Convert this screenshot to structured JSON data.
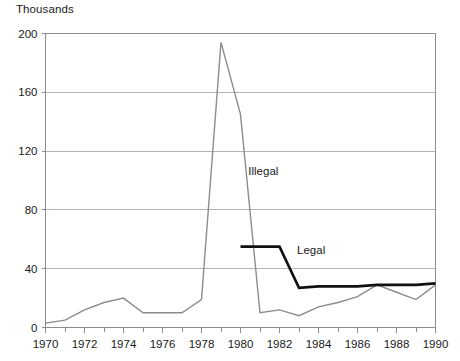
{
  "chart_data": {
    "type": "line",
    "title": "",
    "subtitle": "",
    "xlabel": "",
    "ylabel": "Thousands",
    "unit_label": "Thousands",
    "xlim": [
      1970,
      1990
    ],
    "ylim": [
      0,
      200
    ],
    "grid": true,
    "grid_axis": "y",
    "legend_position": "inline-annotation",
    "y_ticks": [
      0,
      40,
      80,
      120,
      160,
      200
    ],
    "y_tick_labels": [
      "0",
      "40",
      "80",
      "120",
      "160",
      "200"
    ],
    "x_ticks": [
      1970,
      1971,
      1972,
      1973,
      1974,
      1975,
      1976,
      1977,
      1978,
      1979,
      1980,
      1981,
      1982,
      1983,
      1984,
      1985,
      1986,
      1987,
      1988,
      1989,
      1990
    ],
    "x_tick_labels": [
      "1970",
      "",
      "1972",
      "",
      "1974",
      "",
      "1976",
      "",
      "1978",
      "",
      "1980",
      "",
      "1982",
      "",
      "1984",
      "",
      "1986",
      "",
      "1988",
      "",
      "1990"
    ],
    "x_labeled_ticks": [
      1970,
      1972,
      1974,
      1976,
      1978,
      1980,
      1982,
      1984,
      1986,
      1988,
      1990
    ],
    "series": [
      {
        "name": "Illegal",
        "color": "#8c8c8c",
        "line_width": 1.4,
        "x": [
          1970,
          1971,
          1972,
          1973,
          1974,
          1975,
          1976,
          1977,
          1978,
          1979,
          1980,
          1981,
          1982,
          1983,
          1984,
          1985,
          1986,
          1987,
          1988,
          1989,
          1990
        ],
        "values": [
          3,
          5,
          12,
          17,
          20,
          10,
          10,
          10,
          19,
          194,
          145,
          10,
          12,
          8,
          14,
          17,
          21,
          29,
          24,
          19,
          29
        ],
        "annotation": {
          "text": "Illegal",
          "x": 1980.4,
          "y": 104
        }
      },
      {
        "name": "Legal",
        "color": "#111111",
        "line_width": 2.6,
        "x": [
          1980,
          1981,
          1982,
          1983,
          1984,
          1985,
          1986,
          1987,
          1988,
          1989,
          1990
        ],
        "values": [
          55,
          55,
          55,
          27,
          28,
          28,
          28,
          29,
          29,
          29,
          30
        ],
        "annotation": {
          "text": "Legal",
          "x": 1982.9,
          "y": 50
        }
      }
    ],
    "annotations": [
      {
        "name": "illegal-series-label",
        "text": "Illegal"
      },
      {
        "name": "legal-series-label",
        "text": "Legal"
      }
    ],
    "colors": {
      "illegal": "#8c8c8c",
      "legal": "#111111",
      "grid": "#b4b4b4",
      "axis": "#8c8c8c",
      "text": "#1a1a1a",
      "background": "#ffffff"
    }
  }
}
